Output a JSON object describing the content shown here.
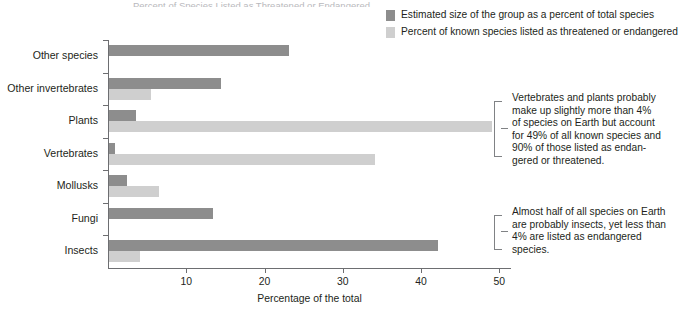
{
  "title_clipped": "Percent of Species Listed as Threatened or Endangered",
  "legend": {
    "items": [
      {
        "label": "Estimated size of the group as a percent of total species",
        "color": "#8d8d8d",
        "name": "dark"
      },
      {
        "label": "Percent of known species listed as threatened or endangered",
        "color": "#cfcfcf",
        "name": "light"
      }
    ]
  },
  "annotations": [
    {
      "id": "vertebrates-plants-note",
      "lines": [
        "Vertebrates and plants probably",
        "make up slightly more than 4%",
        "of species on Earth but account",
        "for 49% of all known species and",
        "90% of those listed as endan-",
        "gered or threatened."
      ]
    },
    {
      "id": "insects-note",
      "lines": [
        "Almost half of all species on Earth",
        "are probably insects, yet less than",
        "4% are listed as endangered species."
      ]
    }
  ],
  "chart_data": {
    "type": "bar",
    "orientation": "horizontal",
    "title": "Percent of Species Listed as Threatened or Endangered",
    "xlabel": "Percentage of the total",
    "ylabel": "",
    "xlim": [
      0,
      51.5
    ],
    "xticks": [
      10,
      20,
      30,
      40,
      50
    ],
    "xtick_labels": [
      "10",
      "20",
      "30",
      "40",
      "50"
    ],
    "grid": false,
    "legend_position": "top-right",
    "categories": [
      "Other species",
      "Other invertebrates",
      "Plants",
      "Vertebrates",
      "Mollusks",
      "Fungi",
      "Insects"
    ],
    "series": [
      {
        "name": "Estimated size of the group as a percent of total species",
        "color": "#8d8d8d",
        "values": [
          23.0,
          14.3,
          3.4,
          0.8,
          2.3,
          13.3,
          42.0
        ]
      },
      {
        "name": "Percent of known species listed as threatened or endangered",
        "color": "#cfcfcf",
        "values": [
          0,
          5.4,
          49.0,
          34.0,
          6.4,
          0,
          4.0
        ]
      }
    ]
  }
}
